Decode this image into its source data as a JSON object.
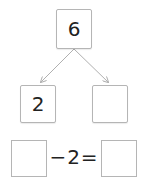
{
  "number_bond": {
    "whole": "6",
    "part_left": "2",
    "part_right": ""
  },
  "equation": {
    "left_blank": "",
    "operator_text": "−2=",
    "right_blank": ""
  }
}
